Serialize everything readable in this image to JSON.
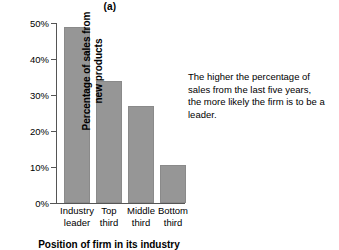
{
  "chart_data": {
    "type": "bar",
    "title": "(a)",
    "categories": [
      "Industry leader",
      "Top third",
      "Middle third",
      "Bottom third"
    ],
    "category_lines": [
      [
        "Industry",
        "leader"
      ],
      [
        "Top",
        "third"
      ],
      [
        "Middle",
        "third"
      ],
      [
        "Bottom",
        "third"
      ]
    ],
    "values": [
      49,
      34,
      27,
      10.5
    ],
    "xlabel": "Position of firm in its industry",
    "ylabel": "Percentage of sales from new products",
    "ylabel_lines": [
      "Percentage of sales from",
      "new products"
    ],
    "ylim": [
      0,
      50
    ],
    "yticks": [
      0,
      10,
      20,
      30,
      40,
      50
    ],
    "ytick_labels": [
      "0%",
      "10%",
      "20%",
      "30%",
      "40%",
      "50%"
    ],
    "grid": false,
    "legend": null,
    "bar_color": "#969696",
    "axis_color": "#555555",
    "annotations": [
      {
        "text": "The higher the percentage of sales from the last five years, the more likely the firm is to be a leader.",
        "lines": [
          "The higher the percentage of",
          "sales from the last five years,",
          "the more likely the firm is to be a",
          "leader."
        ]
      }
    ]
  }
}
